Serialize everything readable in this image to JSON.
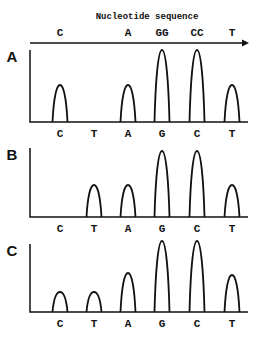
{
  "header": {
    "title": "Nucleotide sequence",
    "sequence_labels": [
      {
        "text": "C",
        "x": 60
      },
      {
        "text": "A",
        "x": 128
      },
      {
        "text": "GG",
        "x": 162
      },
      {
        "text": "CC",
        "x": 197
      },
      {
        "text": "T",
        "x": 232
      }
    ]
  },
  "chart_data": {
    "type": "chromatogram",
    "x_labels": [
      "C",
      "T",
      "A",
      "G",
      "C",
      "T"
    ],
    "panels": [
      {
        "label": "A",
        "heights": [
          37,
          0,
          37,
          72,
          72,
          37
        ]
      },
      {
        "label": "B",
        "heights": [
          0,
          32,
          32,
          66,
          66,
          32
        ]
      },
      {
        "label": "C",
        "heights": [
          20,
          20,
          39,
          71,
          71,
          37
        ]
      }
    ]
  },
  "layout": {
    "peak_x": [
      60,
      94,
      128,
      162,
      197,
      232
    ],
    "panels": [
      {
        "top": 50,
        "baseline": 122,
        "label_y": 137
      },
      {
        "top": 148,
        "baseline": 217,
        "label_y": 232
      },
      {
        "top": 244,
        "baseline": 312,
        "label_y": 327
      }
    ]
  }
}
